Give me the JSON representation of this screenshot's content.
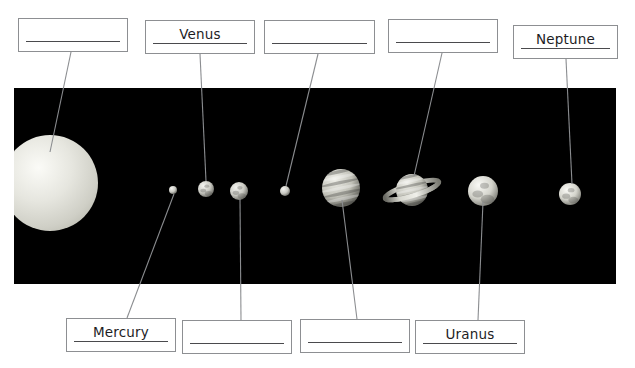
{
  "worksheet": {
    "title": "Solar System Labelling Worksheet",
    "background_color": "#ffffff",
    "space_panel_color": "#000000",
    "box_border_color": "#8d8f92",
    "rule_color": "#4a4a4d",
    "text_color": "#1d1d1f",
    "leader_line_color": "#8b8d90"
  },
  "top_boxes": [
    {
      "id": "top-box-1",
      "answer": "",
      "filled": false,
      "x": 18,
      "y": 18,
      "w": 110,
      "h": 34
    },
    {
      "id": "top-box-2",
      "answer": "Venus",
      "filled": true,
      "x": 145,
      "y": 20,
      "w": 110,
      "h": 34
    },
    {
      "id": "top-box-3",
      "answer": "",
      "filled": false,
      "x": 264,
      "y": 20,
      "w": 111,
      "h": 34
    },
    {
      "id": "top-box-4",
      "answer": "",
      "filled": false,
      "x": 388,
      "y": 19,
      "w": 110,
      "h": 34
    },
    {
      "id": "top-box-5",
      "answer": "Neptune",
      "filled": true,
      "x": 513,
      "y": 25,
      "w": 105,
      "h": 34
    }
  ],
  "bottom_boxes": [
    {
      "id": "bottom-box-1",
      "answer": "Mercury",
      "filled": true,
      "x": 66,
      "y": 318,
      "w": 110,
      "h": 34
    },
    {
      "id": "bottom-box-2",
      "answer": "",
      "filled": false,
      "x": 182,
      "y": 320,
      "w": 110,
      "h": 34
    },
    {
      "id": "bottom-box-3",
      "answer": "",
      "filled": false,
      "x": 300,
      "y": 319,
      "w": 110,
      "h": 34
    },
    {
      "id": "bottom-box-4",
      "answer": "Uranus",
      "filled": true,
      "x": 415,
      "y": 320,
      "w": 110,
      "h": 34
    }
  ],
  "planets": [
    {
      "name": "sun",
      "cx": 50,
      "cy": 183,
      "r": 48,
      "has_rings": false,
      "banded": false,
      "label_slot": "top-box-1"
    },
    {
      "name": "mercury",
      "cx": 173,
      "cy": 190,
      "r": 4,
      "has_rings": false,
      "banded": false,
      "label_slot": "bottom-box-1"
    },
    {
      "name": "venus",
      "cx": 206,
      "cy": 189,
      "r": 8,
      "has_rings": false,
      "banded": false,
      "label_slot": "top-box-2"
    },
    {
      "name": "earth",
      "cx": 239,
      "cy": 191,
      "r": 9,
      "has_rings": false,
      "banded": false,
      "label_slot": "bottom-box-2"
    },
    {
      "name": "mars",
      "cx": 285,
      "cy": 191,
      "r": 5,
      "has_rings": false,
      "banded": false,
      "label_slot": "top-box-3"
    },
    {
      "name": "jupiter",
      "cx": 341,
      "cy": 188,
      "r": 19,
      "has_rings": false,
      "banded": true,
      "label_slot": "bottom-box-3"
    },
    {
      "name": "saturn",
      "cx": 412,
      "cy": 190,
      "r": 16,
      "has_rings": true,
      "banded": true,
      "label_slot": "top-box-4"
    },
    {
      "name": "uranus",
      "cx": 483,
      "cy": 191,
      "r": 15,
      "has_rings": false,
      "banded": false,
      "label_slot": "bottom-box-4"
    },
    {
      "name": "neptune",
      "cx": 570,
      "cy": 194,
      "r": 11,
      "has_rings": false,
      "banded": false,
      "label_slot": "top-box-5"
    }
  ],
  "leader_lines": [
    {
      "from": "top-box-1",
      "to": "sun",
      "x1": 71,
      "y1": 52,
      "x2": 50,
      "y2": 152
    },
    {
      "from": "top-box-2",
      "to": "venus",
      "x1": 200,
      "y1": 54,
      "x2": 206,
      "y2": 181
    },
    {
      "from": "top-box-3",
      "to": "mars",
      "x1": 318,
      "y1": 54,
      "x2": 286,
      "y2": 186
    },
    {
      "from": "top-box-4",
      "to": "saturn",
      "x1": 442,
      "y1": 53,
      "x2": 414,
      "y2": 176
    },
    {
      "from": "top-box-5",
      "to": "neptune",
      "x1": 566,
      "y1": 59,
      "x2": 572,
      "y2": 184
    },
    {
      "from": "bottom-box-1",
      "to": "mercury",
      "x1": 127,
      "y1": 318,
      "x2": 174,
      "y2": 194
    },
    {
      "from": "bottom-box-2",
      "to": "earth",
      "x1": 241,
      "y1": 320,
      "x2": 240,
      "y2": 199
    },
    {
      "from": "bottom-box-3",
      "to": "jupiter",
      "x1": 357,
      "y1": 319,
      "x2": 342,
      "y2": 200
    },
    {
      "from": "bottom-box-4",
      "to": "uranus",
      "x1": 478,
      "y1": 320,
      "x2": 483,
      "y2": 202
    }
  ]
}
